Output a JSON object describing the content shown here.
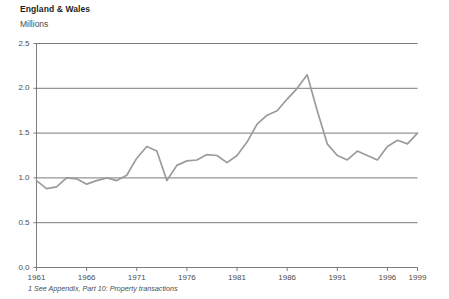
{
  "chart_data": {
    "type": "line",
    "title": "England & Wales",
    "subtitle": "Millions",
    "ylabel": "Millions",
    "xlabel": "",
    "footnote": "1 See Appendix, Part 10: Property transactions",
    "grid": true,
    "legend": "none",
    "line_color": "#9b9b9b",
    "axis_color": "#6d6d6d",
    "xlim": [
      1961,
      1999
    ],
    "ylim": [
      0.0,
      2.5
    ],
    "ytick_labels": [
      "0.0",
      "0.5",
      "1.0",
      "1.5",
      "2.0",
      "2.5"
    ],
    "ytick_values": [
      0.0,
      0.5,
      1.0,
      1.5,
      2.0,
      2.5
    ],
    "xtick_labels": [
      "1961",
      "1966",
      "1971",
      "1976",
      "1981",
      "1986",
      "1991",
      "1996",
      "1999"
    ],
    "xtick_values": [
      1961,
      1966,
      1971,
      1976,
      1981,
      1986,
      1991,
      1996,
      1999
    ],
    "x": [
      1961,
      1962,
      1963,
      1964,
      1965,
      1966,
      1967,
      1968,
      1969,
      1970,
      1971,
      1972,
      1973,
      1974,
      1975,
      1976,
      1977,
      1978,
      1979,
      1980,
      1981,
      1982,
      1983,
      1984,
      1985,
      1986,
      1987,
      1988,
      1989,
      1990,
      1991,
      1992,
      1993,
      1994,
      1995,
      1996,
      1997,
      1998,
      1999
    ],
    "values": [
      0.97,
      0.88,
      0.9,
      1.0,
      0.99,
      0.93,
      0.97,
      1.0,
      0.97,
      1.03,
      1.22,
      1.35,
      1.3,
      0.97,
      1.14,
      1.19,
      1.2,
      1.26,
      1.25,
      1.17,
      1.25,
      1.4,
      1.6,
      1.7,
      1.75,
      1.88,
      2.0,
      2.15,
      1.75,
      1.38,
      1.25,
      1.2,
      1.3,
      1.25,
      1.2,
      1.35,
      1.42,
      1.38,
      1.5
    ],
    "series": [
      {
        "name": "Property transactions",
        "values": [
          0.97,
          0.88,
          0.9,
          1.0,
          0.99,
          0.93,
          0.97,
          1.0,
          0.97,
          1.03,
          1.22,
          1.35,
          1.3,
          0.97,
          1.14,
          1.19,
          1.2,
          1.26,
          1.25,
          1.17,
          1.25,
          1.4,
          1.6,
          1.7,
          1.75,
          1.88,
          2.0,
          2.15,
          1.75,
          1.38,
          1.25,
          1.2,
          1.3,
          1.25,
          1.2,
          1.35,
          1.42,
          1.38,
          1.5
        ]
      }
    ]
  }
}
